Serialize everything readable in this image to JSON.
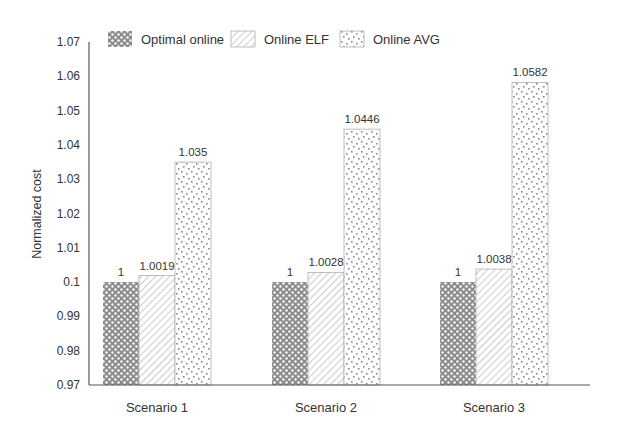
{
  "chart_data": {
    "type": "bar",
    "title": "",
    "xlabel": "",
    "ylabel": "Normalized cost",
    "ylim": [
      0.97,
      1.07
    ],
    "y_ticks": [
      "0.97",
      "0.98",
      "0.99",
      "0.1",
      "1.01",
      "1.02",
      "1.03",
      "1.04",
      "1.05",
      "1.06",
      "1.07"
    ],
    "grid": false,
    "legend_position": "top",
    "categories": [
      "Scenario 1",
      "Scenario 2",
      "Scenario 3"
    ],
    "series": [
      {
        "name": "Optimal online",
        "pattern": "dense-dots-dark",
        "values": [
          1,
          1,
          1
        ],
        "labels": [
          "1",
          "1",
          "1"
        ]
      },
      {
        "name": "Online ELF",
        "pattern": "diagonal-hatch",
        "values": [
          1.0019,
          1.0028,
          1.0038
        ],
        "labels": [
          "1.0019",
          "1.0028",
          "1.0038"
        ]
      },
      {
        "name": "Online AVG",
        "pattern": "sparse-dots-light",
        "values": [
          1.035,
          1.0446,
          1.0582
        ],
        "labels": [
          "1.035",
          "1.0446",
          "1.0582"
        ]
      }
    ],
    "colors": {
      "axis": "#555555",
      "dark_fill": "#8c8c8c",
      "hatch": "#9a9a9a",
      "dots": "#8a8a8a",
      "text": "#333333"
    }
  }
}
